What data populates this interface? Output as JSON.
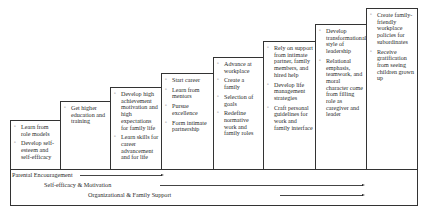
{
  "stages": [
    {
      "items": [
        "Learn from role models",
        "Develop self-esteem and self-efficacy"
      ]
    },
    {
      "items": [
        "Get higher education and training"
      ]
    },
    {
      "items": [
        "Develop high achievement motivation and high expectations for family life",
        "Learn skills for career advancement and for life"
      ]
    },
    {
      "items": [
        "Start career",
        "Learn from mentors",
        "Pursue excellence",
        "Form intimate partnership"
      ]
    },
    {
      "items": [
        "Advance at workplace",
        "Create a family",
        "Selection of goals",
        "Redefine normative work and family roles"
      ]
    },
    {
      "items": [
        "Rely on support from intimate partner, family members, and hired help",
        "Develop life management strategies",
        "Craft personal guidelines for work and family interface"
      ]
    },
    {
      "items": [
        "Develop transformational style of leadership",
        "Relational emphasis, teamwork, and moral character come from filling role as caregiver and leader"
      ]
    },
    {
      "items": [
        "Create family-friendly workplace policies for subordinates",
        "Receive gratification from seeing children grown up"
      ]
    }
  ],
  "bullet_glyph": "▫",
  "flows": [
    {
      "label": "Parental Encouragement"
    },
    {
      "label": "Self-efficacy & Motivation"
    },
    {
      "label": "Organizational & Family Support"
    }
  ]
}
